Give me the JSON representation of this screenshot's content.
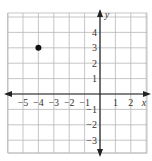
{
  "chart_data": {
    "type": "scatter",
    "title": "",
    "xlabel": "x",
    "ylabel": "y",
    "xlim": [
      -6,
      3
    ],
    "ylim": [
      -4,
      5
    ],
    "grid": true,
    "x_ticks": [
      -5,
      -4,
      -3,
      -2,
      -1,
      1,
      2
    ],
    "y_ticks": [
      4,
      3,
      2,
      1,
      -1,
      -2,
      -3
    ],
    "x_tick_labels": [
      "−5",
      "−4",
      "−3",
      "−2",
      "−1",
      "1",
      "2"
    ],
    "y_tick_labels": [
      "4",
      "3",
      "2",
      "1",
      "−1",
      "−2",
      "−3"
    ],
    "points": [
      {
        "x": -4,
        "y": 3
      }
    ],
    "colors": {
      "grid": "#b8b8b8",
      "axis": "#222222",
      "point": "#111111"
    }
  }
}
